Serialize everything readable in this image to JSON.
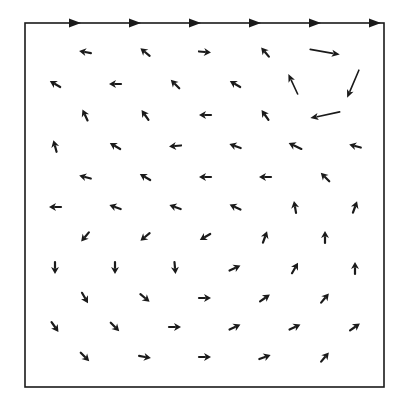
{
  "diagram": {
    "type": "vector_field",
    "description_visible": "",
    "colors": {
      "background": "#ffffff",
      "ink": "#1a1a1a"
    },
    "box": {
      "x0": 25,
      "y0": 23,
      "x1": 384,
      "y1": 387
    },
    "lid": {
      "y": 23,
      "arrows_x": [
        77,
        137,
        197,
        257,
        317,
        377
      ]
    },
    "vectors": [
      {
        "x": 85,
        "y": 52,
        "angle": -170,
        "len": 12
      },
      {
        "x": 145,
        "y": 52,
        "angle": -140,
        "len": 12
      },
      {
        "x": 205,
        "y": 52,
        "angle": 5,
        "len": 12
      },
      {
        "x": 265,
        "y": 52,
        "angle": -130,
        "len": 12
      },
      {
        "x": 325,
        "y": 52,
        "angle": 10,
        "len": 30
      },
      {
        "x": 55,
        "y": 84,
        "angle": -150,
        "len": 12
      },
      {
        "x": 115,
        "y": 84,
        "angle": 180,
        "len": 12
      },
      {
        "x": 175,
        "y": 84,
        "angle": -135,
        "len": 12
      },
      {
        "x": 235,
        "y": 84,
        "angle": -150,
        "len": 12
      },
      {
        "x": 293,
        "y": 84,
        "angle": -115,
        "len": 22
      },
      {
        "x": 353,
        "y": 84,
        "angle": 113,
        "len": 30
      },
      {
        "x": 85,
        "y": 115,
        "angle": -115,
        "len": 12
      },
      {
        "x": 145,
        "y": 115,
        "angle": -125,
        "len": 12
      },
      {
        "x": 205,
        "y": 115,
        "angle": 180,
        "len": 12
      },
      {
        "x": 265,
        "y": 115,
        "angle": -125,
        "len": 12
      },
      {
        "x": 325,
        "y": 115,
        "angle": 168,
        "len": 30
      },
      {
        "x": 55,
        "y": 146,
        "angle": -105,
        "len": 12
      },
      {
        "x": 115,
        "y": 146,
        "angle": -150,
        "len": 12
      },
      {
        "x": 175,
        "y": 146,
        "angle": 175,
        "len": 12
      },
      {
        "x": 235,
        "y": 146,
        "angle": -160,
        "len": 12
      },
      {
        "x": 295,
        "y": 146,
        "angle": -155,
        "len": 14
      },
      {
        "x": 355,
        "y": 146,
        "angle": -165,
        "len": 12
      },
      {
        "x": 85,
        "y": 177,
        "angle": -165,
        "len": 12
      },
      {
        "x": 145,
        "y": 177,
        "angle": -150,
        "len": 12
      },
      {
        "x": 205,
        "y": 177,
        "angle": 180,
        "len": 12
      },
      {
        "x": 265,
        "y": 177,
        "angle": 180,
        "len": 12
      },
      {
        "x": 325,
        "y": 177,
        "angle": -135,
        "len": 12
      },
      {
        "x": 55,
        "y": 207,
        "angle": 180,
        "len": 12
      },
      {
        "x": 115,
        "y": 207,
        "angle": -160,
        "len": 12
      },
      {
        "x": 175,
        "y": 207,
        "angle": -160,
        "len": 12
      },
      {
        "x": 235,
        "y": 207,
        "angle": -155,
        "len": 12
      },
      {
        "x": 295,
        "y": 207,
        "angle": -100,
        "len": 12
      },
      {
        "x": 355,
        "y": 207,
        "angle": -70,
        "len": 12
      },
      {
        "x": 85,
        "y": 237,
        "angle": 130,
        "len": 12
      },
      {
        "x": 145,
        "y": 237,
        "angle": 140,
        "len": 12
      },
      {
        "x": 205,
        "y": 237,
        "angle": 150,
        "len": 12
      },
      {
        "x": 265,
        "y": 237,
        "angle": -70,
        "len": 12
      },
      {
        "x": 325,
        "y": 237,
        "angle": -90,
        "len": 12
      },
      {
        "x": 55,
        "y": 268,
        "angle": 90,
        "len": 12
      },
      {
        "x": 115,
        "y": 268,
        "angle": 90,
        "len": 12
      },
      {
        "x": 175,
        "y": 268,
        "angle": 85,
        "len": 12
      },
      {
        "x": 235,
        "y": 268,
        "angle": -25,
        "len": 12
      },
      {
        "x": 295,
        "y": 268,
        "angle": -60,
        "len": 12
      },
      {
        "x": 355,
        "y": 268,
        "angle": -90,
        "len": 12
      },
      {
        "x": 85,
        "y": 298,
        "angle": 60,
        "len": 12
      },
      {
        "x": 145,
        "y": 298,
        "angle": 40,
        "len": 12
      },
      {
        "x": 205,
        "y": 298,
        "angle": 0,
        "len": 12
      },
      {
        "x": 265,
        "y": 298,
        "angle": -35,
        "len": 12
      },
      {
        "x": 325,
        "y": 298,
        "angle": -50,
        "len": 12
      },
      {
        "x": 55,
        "y": 327,
        "angle": 55,
        "len": 12
      },
      {
        "x": 115,
        "y": 327,
        "angle": 45,
        "len": 12
      },
      {
        "x": 175,
        "y": 327,
        "angle": 0,
        "len": 12
      },
      {
        "x": 235,
        "y": 327,
        "angle": -25,
        "len": 12
      },
      {
        "x": 295,
        "y": 327,
        "angle": -25,
        "len": 12
      },
      {
        "x": 355,
        "y": 327,
        "angle": -35,
        "len": 12
      },
      {
        "x": 85,
        "y": 357,
        "angle": 45,
        "len": 12
      },
      {
        "x": 145,
        "y": 357,
        "angle": 10,
        "len": 12
      },
      {
        "x": 205,
        "y": 357,
        "angle": 0,
        "len": 12
      },
      {
        "x": 265,
        "y": 357,
        "angle": -20,
        "len": 12
      },
      {
        "x": 325,
        "y": 357,
        "angle": -50,
        "len": 12
      }
    ]
  }
}
